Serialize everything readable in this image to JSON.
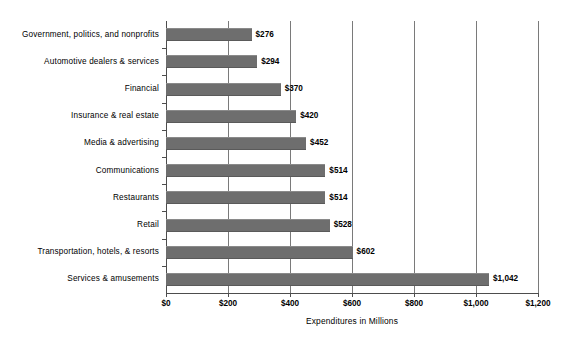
{
  "chart_data": {
    "type": "bar",
    "orientation": "horizontal",
    "title": "",
    "xlabel": "Expenditures in Millions",
    "ylabel": "",
    "xlim": [
      0,
      1200
    ],
    "xticks": [
      0,
      200,
      400,
      600,
      800,
      1000,
      1200
    ],
    "xtick_labels": [
      "$0",
      "$200",
      "$400",
      "$600",
      "$800",
      "$1,000",
      "$1,200"
    ],
    "grid": "vertical",
    "legend": "none",
    "bar_color": "#6e6e6e",
    "categories": [
      "Government, politics, and nonprofits",
      "Automotive dealers & services",
      "Financial",
      "Insurance & real estate",
      "Media & advertising",
      "Communications",
      "Restaurants",
      "Retail",
      "Transportation, hotels, & resorts",
      "Services & amusements"
    ],
    "values": [
      276,
      294,
      370,
      420,
      452,
      514,
      514,
      528,
      602,
      1042
    ],
    "value_labels": [
      "$276",
      "$294",
      "$370",
      "$420",
      "$452",
      "$514",
      "$514",
      "$528",
      "$602",
      "$1,042"
    ]
  }
}
